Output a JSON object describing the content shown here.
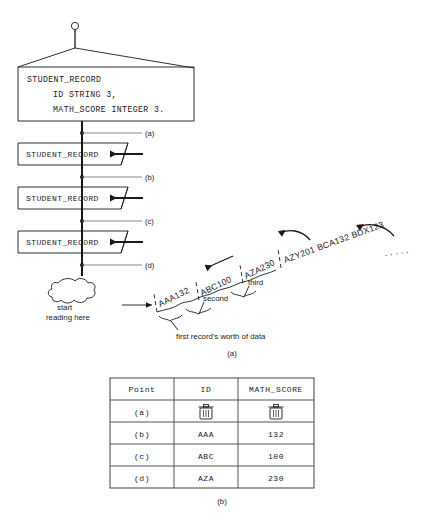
{
  "figure": {
    "title_caption_a": "(a)",
    "title_caption_b": "(b)",
    "declaration": {
      "line1": "STUDENT_RECORD",
      "line2": "ID STRING 3,",
      "line3": "MATH_SCORE INTEGER 3."
    },
    "record_boxes": [
      {
        "label": "STUDENT_RECORD"
      },
      {
        "label": "STUDENT_RECORD"
      },
      {
        "label": "STUDENT_RECORD"
      }
    ],
    "point_labels": [
      "(a)",
      "(b)",
      "(c)",
      "(d)"
    ],
    "cloud_note": {
      "line1": "start",
      "line2": "reading here"
    },
    "data_stream": {
      "chunks": [
        "AAA132",
        "ABC100",
        "AZA230"
      ],
      "tail": "AZY201  BCA132  BDX123",
      "ellipsis": ". . . . .",
      "brace_labels": {
        "first": "first record's worth of data",
        "second": "second",
        "third": "third"
      }
    }
  },
  "table": {
    "headers": [
      "Point",
      "ID",
      "MATH_SCORE"
    ],
    "rows": [
      {
        "point": "(a)",
        "id": "trash-icon",
        "math_score": "trash-icon",
        "id_is_icon": true
      },
      {
        "point": "(b)",
        "id": "AAA",
        "math_score": "132",
        "id_is_icon": false
      },
      {
        "point": "(c)",
        "id": "ABC",
        "math_score": "100",
        "id_is_icon": false
      },
      {
        "point": "(d)",
        "id": "AZA",
        "math_score": "230",
        "id_is_icon": false
      }
    ]
  },
  "colors": {
    "ink": "#1a1a1a",
    "leader": "#6e6e6e",
    "table_rule": "#555555",
    "background": "#ffffff"
  }
}
